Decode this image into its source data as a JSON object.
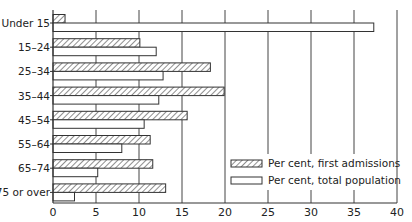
{
  "chart_data": {
    "type": "bar",
    "orientation": "horizontal",
    "title": "",
    "xlabel": "",
    "ylabel": "",
    "xlim": [
      0,
      40
    ],
    "x_ticks": [
      0,
      5,
      10,
      15,
      20,
      25,
      30,
      35,
      40
    ],
    "grid": "vertical",
    "legend_position": "lower right",
    "categories": [
      "Under 15",
      "15-24",
      "25-34",
      "35-44",
      "45-54",
      "55-64",
      "65-74",
      "75 or over"
    ],
    "series": [
      {
        "name": "Per cent, first admissions",
        "pattern": "hatched",
        "values": [
          1.4,
          10.1,
          18.3,
          19.9,
          15.6,
          11.3,
          11.6,
          13.1
        ]
      },
      {
        "name": "Per cent, total population",
        "pattern": "open",
        "values": [
          37.3,
          12.0,
          12.8,
          12.3,
          10.6,
          8.0,
          5.2,
          2.5
        ]
      }
    ]
  },
  "colors": {
    "line": "#333333",
    "fill_open": "#ffffff",
    "hatch": "#444444"
  }
}
